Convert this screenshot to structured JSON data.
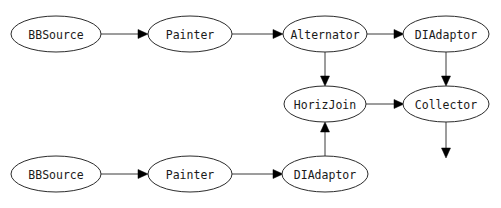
{
  "diagram": {
    "background_color": "#ffffff",
    "node_stroke_color": "#2b2b2b",
    "edge_color": "#3a3a3a",
    "arrowhead_color": "#000000",
    "label_color": "#1a1a1a",
    "nodes": [
      {
        "id": "bbsource_top",
        "label": "BBSource",
        "cx": 56,
        "cy": 34,
        "rx": 45,
        "ry": 18
      },
      {
        "id": "painter_top",
        "label": "Painter",
        "cx": 190,
        "cy": 34,
        "rx": 42,
        "ry": 18
      },
      {
        "id": "alternator",
        "label": "Alternator",
        "cx": 325,
        "cy": 34,
        "rx": 42,
        "ry": 18
      },
      {
        "id": "diadaptor_top",
        "label": "DIAdaptor",
        "cx": 446,
        "cy": 34,
        "rx": 43,
        "ry": 18
      },
      {
        "id": "horizjoin",
        "label": "HorizJoin",
        "cx": 325,
        "cy": 104,
        "rx": 41,
        "ry": 18
      },
      {
        "id": "collector",
        "label": "Collector",
        "cx": 446,
        "cy": 104,
        "rx": 43,
        "ry": 18
      },
      {
        "id": "bbsource_bot",
        "label": "BBSource",
        "cx": 56,
        "cy": 174,
        "rx": 45,
        "ry": 18
      },
      {
        "id": "painter_bot",
        "label": "Painter",
        "cx": 190,
        "cy": 174,
        "rx": 42,
        "ry": 18
      },
      {
        "id": "diadaptor_bot",
        "label": "DIAdaptor",
        "cx": 325,
        "cy": 174,
        "rx": 43,
        "ry": 18
      }
    ],
    "edges": [
      {
        "id": "e1",
        "from": "bbsource_top",
        "to": "painter_top",
        "direction": "right"
      },
      {
        "id": "e2",
        "from": "painter_top",
        "to": "alternator",
        "direction": "right"
      },
      {
        "id": "e3",
        "from": "alternator",
        "to": "diadaptor_top",
        "direction": "right"
      },
      {
        "id": "e4",
        "from": "alternator",
        "to": "horizjoin",
        "direction": "down"
      },
      {
        "id": "e5",
        "from": "diadaptor_top",
        "to": "collector",
        "direction": "down"
      },
      {
        "id": "e6",
        "from": "horizjoin",
        "to": "collector",
        "direction": "right"
      },
      {
        "id": "e7",
        "from": "diadaptor_bot",
        "to": "horizjoin",
        "direction": "up"
      },
      {
        "id": "e8",
        "from": "collector",
        "to": "output",
        "direction": "down"
      },
      {
        "id": "e9",
        "from": "bbsource_bot",
        "to": "painter_bot",
        "direction": "right"
      },
      {
        "id": "e10",
        "from": "painter_bot",
        "to": "diadaptor_bot",
        "direction": "right"
      }
    ]
  }
}
